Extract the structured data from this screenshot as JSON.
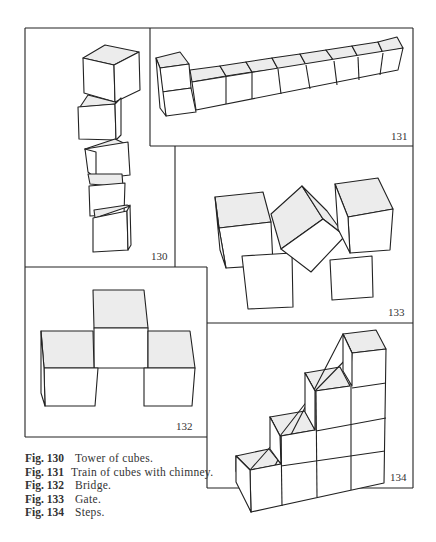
{
  "figures": [
    {
      "id": "130",
      "number_label": "130",
      "subject": "Tower of cubes"
    },
    {
      "id": "131",
      "number_label": "131",
      "subject": "Train of cubes with chimney"
    },
    {
      "id": "132",
      "number_label": "132",
      "subject": "Bridge"
    },
    {
      "id": "133",
      "number_label": "133",
      "subject": "Gate"
    },
    {
      "id": "134",
      "number_label": "134",
      "subject": "Steps"
    }
  ],
  "captions": [
    {
      "label": "Fig. 130",
      "text": "Tower of cubes."
    },
    {
      "label": "Fig. 131",
      "text": "Train of cubes with chimney."
    },
    {
      "label": "Fig. 132",
      "text": "Bridge."
    },
    {
      "label": "Fig. 133",
      "text": "Gate."
    },
    {
      "label": "Fig. 134",
      "text": "Steps."
    }
  ],
  "colors": {
    "line": "#222222",
    "shade": "#ececec",
    "paper": "#ffffff"
  }
}
